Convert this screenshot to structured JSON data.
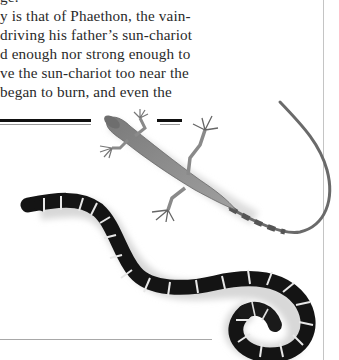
{
  "page": {
    "text_lines": [
      "ge.",
      "y is that of Phaethon, the vain-",
      " driving his father’s sun-chariot",
      "d enough nor strong enough to",
      "ve the sun-chariot too near the",
      " began to burn, and even the"
    ]
  },
  "illustrations": {
    "lizard": {
      "label": "lizard-photo",
      "color": "#8a8a8a"
    },
    "snake": {
      "label": "banded-snake-photo",
      "body_color": "#141414",
      "band_color": "#e8e8e8"
    }
  },
  "rules": {
    "top_rule_color": "#111111",
    "thin_rule_color": "#9a9a9a",
    "column_rule_color": "#c4c4c4"
  }
}
